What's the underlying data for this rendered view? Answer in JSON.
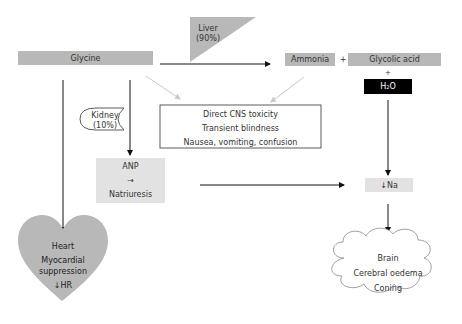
{
  "nodes": {
    "glycine": "Glycine",
    "liver": {
      "line1": "Liver",
      "line2": "(90%)"
    },
    "ammonia": "Ammonia",
    "plus1": "+",
    "glycolic_acid": "Glycolic acid",
    "plus2": "+",
    "water": {
      "main": "H",
      "sub": "2",
      "tail": "O"
    },
    "kidney": {
      "line1": "Kidney",
      "line2": "(10%)"
    },
    "cns_box": [
      "Direct CNS toxicity",
      "Transient blindness",
      "Nausea, vomiting, confusion"
    ],
    "anp": {
      "line1": "ANP",
      "line2": "→",
      "line3": "Natriuresis"
    },
    "sodium": "↓Na",
    "heart": {
      "line1": "Heart",
      "line2": "Myocardial",
      "line3": "suppression",
      "line4": "↓HR"
    },
    "brain": {
      "line1": "Brain",
      "line2": "Cerebral oedema",
      "line3": "Coning"
    }
  },
  "colors": {
    "grey_box": "#b8b8b8",
    "light_box": "#e2e2e2",
    "dark_box": "#000000",
    "arrow": "#111111",
    "faint_arrow": "#c8c8c8"
  }
}
